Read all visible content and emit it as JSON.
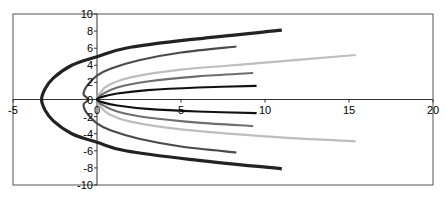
{
  "chart_data": {
    "type": "line",
    "title": "",
    "xlabel": "",
    "ylabel": "",
    "xlim": [
      -5,
      20
    ],
    "ylim": [
      -10,
      10
    ],
    "grid": false,
    "legend": null,
    "x_ticks": [
      -5,
      0,
      5,
      10,
      15,
      20
    ],
    "y_ticks": [
      -10,
      -8,
      -6,
      -4,
      -2,
      0,
      2,
      4,
      6,
      8,
      10
    ],
    "x_tick_labels": [
      "-5",
      "0",
      "5",
      "10",
      "15",
      "20"
    ],
    "y_tick_labels": [
      "-10",
      "-8",
      "-6",
      "-4",
      "-2",
      "0",
      "2",
      "4",
      "6",
      "8",
      "10"
    ],
    "series": [
      {
        "name": "Series 1",
        "color": "#222222",
        "width": 3.2,
        "points": [
          [
            11,
            -8.1
          ],
          [
            5.5,
            -7
          ],
          [
            1.7,
            -6
          ],
          [
            0,
            -5
          ],
          [
            -1.5,
            -4
          ],
          [
            -2.6,
            -2.5
          ],
          [
            -3.1,
            -1.2
          ],
          [
            -3.3,
            0
          ],
          [
            -3.1,
            1.2
          ],
          [
            -2.6,
            2.5
          ],
          [
            -1.5,
            4
          ],
          [
            0,
            5
          ],
          [
            1.7,
            6
          ],
          [
            5.5,
            7
          ],
          [
            11,
            8.1
          ]
        ]
      },
      {
        "name": "Series 2",
        "color": "#4a4a4a",
        "width": 2.2,
        "points": [
          [
            8.3,
            -6.2
          ],
          [
            5,
            -5.5
          ],
          [
            2.5,
            -4.6
          ],
          [
            0.8,
            -3.6
          ],
          [
            0,
            -2.8
          ],
          [
            -0.6,
            -1.6
          ],
          [
            -0.8,
            -0.6
          ],
          [
            -0.5,
            0
          ],
          [
            -0.8,
            0.6
          ],
          [
            -0.6,
            1.6
          ],
          [
            0,
            2.8
          ],
          [
            0.8,
            3.6
          ],
          [
            2.5,
            4.6
          ],
          [
            5,
            5.5
          ],
          [
            8.3,
            6.2
          ]
        ]
      },
      {
        "name": "Series 3",
        "color": "#bdbdbd",
        "width": 2.2,
        "points": [
          [
            15.4,
            -4.9
          ],
          [
            10,
            -4.3
          ],
          [
            5,
            -3.5
          ],
          [
            2,
            -2.6
          ],
          [
            0.7,
            -1.7
          ],
          [
            0.2,
            -0.8
          ],
          [
            0,
            0
          ],
          [
            0.2,
            0.8
          ],
          [
            0.7,
            1.7
          ],
          [
            2,
            2.6
          ],
          [
            5,
            3.5
          ],
          [
            10,
            4.3
          ],
          [
            15.4,
            5.2
          ]
        ]
      },
      {
        "name": "Series 4",
        "color": "#6e6e6e",
        "width": 2.2,
        "points": [
          [
            9.3,
            -3.1
          ],
          [
            6,
            -2.7
          ],
          [
            3,
            -2.1
          ],
          [
            1.2,
            -1.4
          ],
          [
            0.3,
            -0.6
          ],
          [
            0,
            0
          ],
          [
            0.3,
            0.6
          ],
          [
            1.2,
            1.4
          ],
          [
            3,
            2.1
          ],
          [
            6,
            2.7
          ],
          [
            9.3,
            3.1
          ]
        ]
      },
      {
        "name": "Series 5",
        "color": "#111111",
        "width": 2.2,
        "points": [
          [
            9.5,
            -1.6
          ],
          [
            6,
            -1.4
          ],
          [
            3,
            -1.1
          ],
          [
            1.2,
            -0.7
          ],
          [
            0.3,
            -0.3
          ],
          [
            0,
            0
          ],
          [
            0.3,
            0.3
          ],
          [
            1.2,
            0.7
          ],
          [
            3,
            1.1
          ],
          [
            6,
            1.4
          ],
          [
            9.5,
            1.6
          ]
        ]
      }
    ]
  },
  "plot_area": {
    "left": 13,
    "right": 433,
    "top": 14,
    "bottom": 185,
    "frame_color": "#555555"
  }
}
